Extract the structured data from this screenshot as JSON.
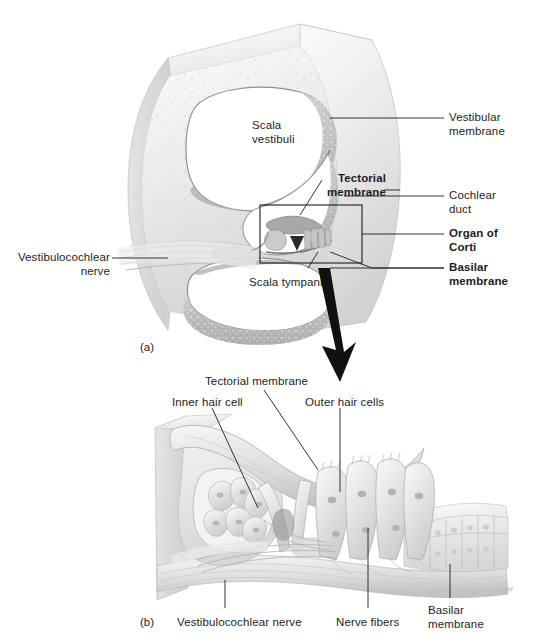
{
  "figure": {
    "background_color": "#ffffff",
    "line_color": "#1d1d1d",
    "artist_signature": "Lew"
  },
  "panel_a": {
    "id": "(a)",
    "caption_labels": {
      "scala_vestibuli": "Scala\nvestibuli",
      "scala_tympani": "Scala tympani",
      "tectorial_membrane": "Tectorial\nmembrane",
      "vestibular_membrane": "Vestibular\nmembrane",
      "cochlear_duct": "Cochlear\nduct",
      "organ_of_corti": "Organ of\nCorti",
      "basilar_membrane": "Basilar\nmembrane",
      "vestibulocochlear_nerve": "Vestibulocochlear\nnerve"
    },
    "bold_labels": [
      "Tectorial membrane",
      "Organ of Corti",
      "Basilar membrane"
    ],
    "inset_box": "magnified region of the organ of Corti",
    "arrow": "magnification arrow pointing down to panel b"
  },
  "panel_b": {
    "id": "(b)",
    "caption_labels": {
      "tectorial_membrane": "Tectorial membrane",
      "inner_hair_cell": "Inner hair cell",
      "outer_hair_cells": "Outer hair cells",
      "vestibulocochlear_nerve": "Vestibulocochlear nerve",
      "nerve_fibers": "Nerve fibers",
      "basilar_membrane": "Basilar\nmembrane"
    }
  }
}
